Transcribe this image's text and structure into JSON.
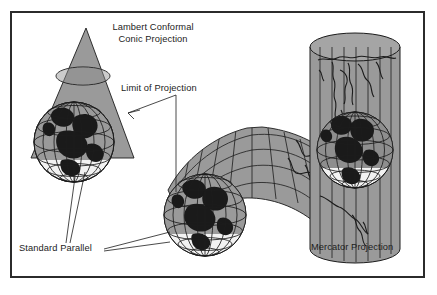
{
  "figure": {
    "type": "cartographic-projection-diagram",
    "background_color": "#ffffff",
    "frame_color": "#2b2b2b",
    "fill_gray": "#9a9a9a",
    "line_color": "#1c1c1c",
    "land_color": "#1a1a1a"
  },
  "labels": {
    "title_line1": "Lambert Conformal",
    "title_line2": "Conic Projection",
    "limit_of_projection": "Limit of Projection",
    "standard_parallel": "Standard Parallel",
    "mercator_projection": "Mercator Projection"
  },
  "diagrams": [
    {
      "name": "cone-over-globe",
      "description": "Cone tangent over a wireframe globe illustrating the Lambert Conformal Conic Projection",
      "parts": [
        "cone",
        "standard-parallel-circle",
        "globe-graticule",
        "continents"
      ]
    },
    {
      "name": "developed-conic-surface",
      "description": "Unrolled conic surface with graticule and coastlines intersecting a wireframe globe",
      "parts": [
        "developed-cone-sheet",
        "projection-graticule",
        "coastlines",
        "globe-graticule",
        "continents"
      ]
    },
    {
      "name": "cylinder-over-globe",
      "description": "Cylinder wrapped around a wireframe globe illustrating the Mercator Projection",
      "parts": [
        "cylinder",
        "meridian-lines",
        "coastlines",
        "globe-graticule",
        "continents"
      ]
    }
  ]
}
